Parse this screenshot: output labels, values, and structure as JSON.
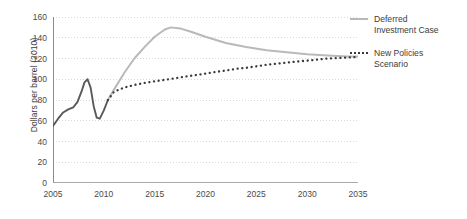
{
  "chart_data": {
    "type": "line",
    "title": "",
    "xlabel": "",
    "ylabel": "Dollars per barrel (2010)",
    "xlim": [
      2005,
      2035
    ],
    "ylim": [
      0,
      160
    ],
    "ytick_step": 20,
    "xtick_step": 5,
    "grid": true,
    "grid_style": "dotted-horizontal",
    "legend_position": "right",
    "xticks": [
      "2005",
      "2010",
      "2015",
      "2020",
      "2025",
      "2030",
      "2035"
    ],
    "yticks": [
      "0",
      "20",
      "40",
      "60",
      "80",
      "100",
      "120",
      "140",
      "160"
    ],
    "series": [
      {
        "name": "Historical",
        "style": "solid",
        "color": "#595959",
        "width": 1.9,
        "show_in_legend": false,
        "x": [
          2005,
          2005.5,
          2006,
          2006.5,
          2007,
          2007.4,
          2007.8,
          2008.1,
          2008.4,
          2008.7,
          2009,
          2009.3,
          2009.6,
          2010,
          2010.4
        ],
        "values": [
          55,
          62,
          68,
          71,
          73,
          78,
          88,
          97,
          100,
          92,
          74,
          63,
          62,
          70,
          80
        ]
      },
      {
        "name": "Deferred Investment Case",
        "style": "solid",
        "color": "#b9b9b9",
        "width": 2.0,
        "show_in_legend": true,
        "x": [
          2010.4,
          2011,
          2012,
          2013,
          2014,
          2015,
          2016,
          2016.6,
          2017.5,
          2018.5,
          2020,
          2022,
          2024,
          2026,
          2028,
          2030,
          2032,
          2034,
          2035
        ],
        "values": [
          80,
          90,
          106,
          120,
          131,
          141,
          148,
          150,
          149,
          146,
          141,
          135,
          131,
          128,
          126,
          124,
          123,
          122,
          122
        ]
      },
      {
        "name": "New Policies Scenario",
        "style": "dotted",
        "color": "#3a3a3a",
        "width": 2.3,
        "show_in_legend": true,
        "x": [
          2010.4,
          2011,
          2012,
          2013,
          2014,
          2015,
          2016,
          2017,
          2018,
          2019,
          2020,
          2021,
          2022,
          2023,
          2024,
          2025,
          2026,
          2027,
          2028,
          2029,
          2030,
          2031,
          2032,
          2033,
          2034,
          2035
        ],
        "values": [
          80,
          88,
          92,
          94.5,
          96.5,
          98,
          99.5,
          101,
          102.5,
          104,
          105.5,
          107,
          108.5,
          110,
          111,
          112.5,
          114,
          115,
          116,
          117,
          118,
          119,
          120,
          120.5,
          121,
          121.5
        ]
      }
    ],
    "legend": [
      {
        "label_line1": "Deferred",
        "label_line2": "Investment Case",
        "style": "solid",
        "color": "#b9b9b9"
      },
      {
        "label_line1": "New Policies",
        "label_line2": "Scenario",
        "style": "dotted",
        "color": "#3a3a3a"
      }
    ]
  }
}
